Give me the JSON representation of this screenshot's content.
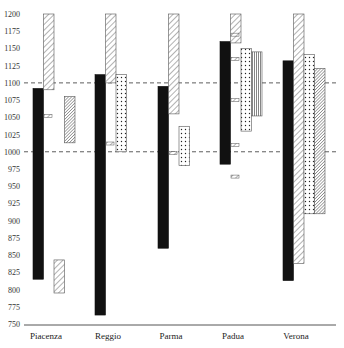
{
  "chart_data": {
    "type": "bar",
    "subtype": "floating-range",
    "title": "",
    "xlabel": "",
    "ylabel": "",
    "ylim": [
      750,
      1200
    ],
    "yticks": [
      750,
      775,
      800,
      825,
      850,
      875,
      900,
      925,
      950,
      975,
      1000,
      1025,
      1050,
      1075,
      1100,
      1125,
      1150,
      1175,
      1200
    ],
    "reference_lines": [
      1000,
      1100
    ],
    "categories": [
      "Piacenza",
      "Reggio",
      "Parma",
      "Padua",
      "Verona"
    ],
    "ranges": [
      {
        "category": "Piacenza",
        "bars": [
          {
            "pattern": "solid",
            "from": 815,
            "to": 1092
          },
          {
            "pattern": "diagonal",
            "from": 1090,
            "to": 1200
          },
          {
            "pattern": "diagonal",
            "from": 795,
            "to": 843
          },
          {
            "pattern": "dense-diagonal",
            "from": 1013,
            "to": 1080
          }
        ],
        "markers": [
          1052
        ]
      },
      {
        "category": "Reggio",
        "bars": [
          {
            "pattern": "solid",
            "from": 763,
            "to": 1112
          },
          {
            "pattern": "diagonal",
            "from": 1100,
            "to": 1200
          },
          {
            "pattern": "dotted",
            "from": 1000,
            "to": 1112
          }
        ],
        "markers": [
          1012
        ]
      },
      {
        "category": "Parma",
        "bars": [
          {
            "pattern": "solid",
            "from": 860,
            "to": 1095
          },
          {
            "pattern": "diagonal",
            "from": 1055,
            "to": 1200
          },
          {
            "pattern": "dotted",
            "from": 980,
            "to": 1037
          }
        ],
        "markers": [
          998
        ]
      },
      {
        "category": "Padua",
        "bars": [
          {
            "pattern": "solid",
            "from": 982,
            "to": 1160
          },
          {
            "pattern": "diagonal",
            "from": 1158,
            "to": 1200
          },
          {
            "pattern": "dotted",
            "from": 1030,
            "to": 1150
          },
          {
            "pattern": "vertical",
            "from": 1052,
            "to": 1145
          }
        ],
        "markers": [
          1170,
          1135,
          1075,
          1010,
          964
        ]
      },
      {
        "category": "Verona",
        "bars": [
          {
            "pattern": "solid",
            "from": 813,
            "to": 1132
          },
          {
            "pattern": "diagonal",
            "from": 838,
            "to": 1200
          },
          {
            "pattern": "dotted",
            "from": 910,
            "to": 1141
          },
          {
            "pattern": "dense-diagonal",
            "from": 910,
            "to": 1121
          }
        ],
        "markers": []
      }
    ]
  }
}
